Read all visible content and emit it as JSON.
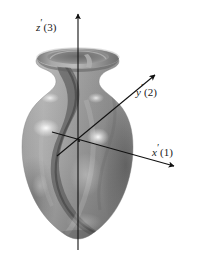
{
  "figure": {
    "background_color": "#ffffff",
    "width": 198,
    "height": 258
  },
  "axes": {
    "line_color": "#111111",
    "items": [
      {
        "id": "z-axis",
        "symbol": "z",
        "prime": "′",
        "number": "(3)",
        "label_full": "z′(3)",
        "direction": "vertical-up"
      },
      {
        "id": "y-axis",
        "symbol": "y",
        "prime": "′",
        "number": "(2)",
        "label_full": "y′(2)",
        "direction": "upper-right"
      },
      {
        "id": "x-axis",
        "symbol": "x",
        "prime": "′",
        "number": "(1)",
        "label_full": "x′(1)",
        "direction": "lower-right"
      }
    ]
  },
  "object": {
    "name": "vase",
    "material": "glazed ceramic",
    "body_color": "#8f8f8f",
    "shadow_color": "#595959",
    "highlight_color": "#e8e8e8",
    "swirl_color": "#4a4a4a"
  }
}
